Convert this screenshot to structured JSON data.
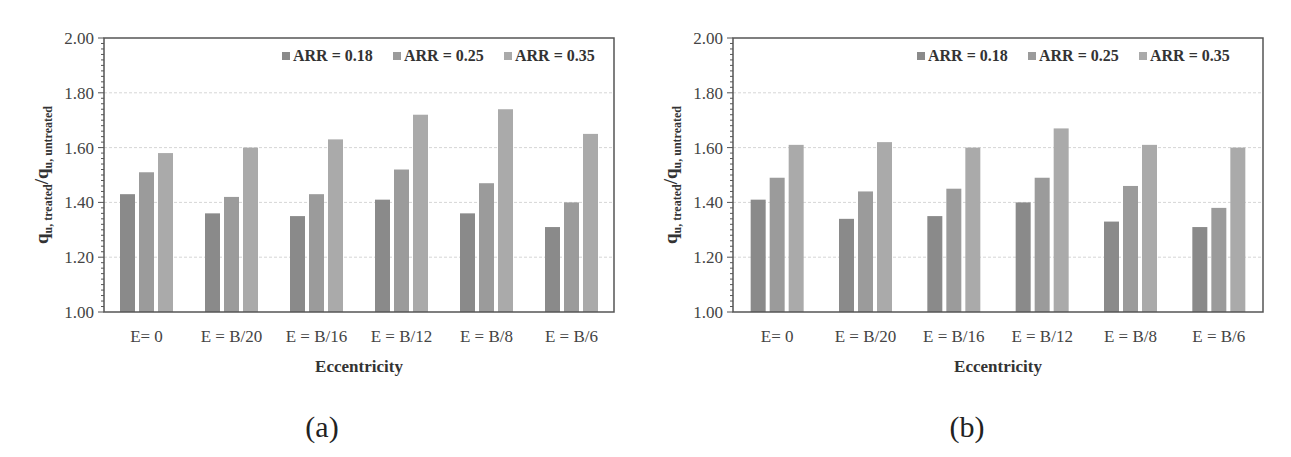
{
  "figure": {
    "captions": [
      "(a)",
      "(b)"
    ]
  },
  "colors": {
    "series": [
      "#8a8a8a",
      "#9b9b9b",
      "#aaaaaa"
    ],
    "grid": "#d6d6d6",
    "frame": "#555555"
  },
  "chart_data": [
    {
      "type": "bar",
      "panel": "(a)",
      "title": "",
      "xlabel": "Eccentricity",
      "ylabel": "q_u, treated / q_u, untreated",
      "ylabel_parts": {
        "main1": "q",
        "sub1": "u, treated",
        "slash": "/",
        "main2": "q",
        "sub2": "u, untreated"
      },
      "ylim": [
        1.0,
        2.0
      ],
      "yticks": [
        "1.00",
        "1.20",
        "1.40",
        "1.60",
        "1.80",
        "2.00"
      ],
      "grid": true,
      "legend_position": "top-right",
      "categories": [
        "E= 0",
        "E = B/20",
        "E = B/16",
        "E = B/12",
        "E = B/8",
        "E = B/6"
      ],
      "series": [
        {
          "name": "ARR = 0.18",
          "values": [
            1.43,
            1.36,
            1.35,
            1.41,
            1.36,
            1.31
          ]
        },
        {
          "name": "ARR = 0.25",
          "values": [
            1.51,
            1.42,
            1.43,
            1.52,
            1.47,
            1.4
          ]
        },
        {
          "name": "ARR = 0.35",
          "values": [
            1.58,
            1.6,
            1.63,
            1.72,
            1.74,
            1.65
          ]
        }
      ]
    },
    {
      "type": "bar",
      "panel": "(b)",
      "title": "",
      "xlabel": "Eccentricity",
      "ylabel": "q_u, treated / q_u, untreated",
      "ylabel_parts": {
        "main1": "q",
        "sub1": "u, treated",
        "slash": "/",
        "main2": "q",
        "sub2": "u, untreated"
      },
      "ylim": [
        1.0,
        2.0
      ],
      "yticks": [
        "1.00",
        "1.20",
        "1.40",
        "1.60",
        "1.80",
        "2.00"
      ],
      "grid": true,
      "legend_position": "top-right",
      "categories": [
        "E= 0",
        "E = B/20",
        "E = B/16",
        "E = B/12",
        "E = B/8",
        "E = B/6"
      ],
      "series": [
        {
          "name": "ARR = 0.18",
          "values": [
            1.41,
            1.34,
            1.35,
            1.4,
            1.33,
            1.31
          ]
        },
        {
          "name": "ARR = 0.25",
          "values": [
            1.49,
            1.44,
            1.45,
            1.49,
            1.46,
            1.38
          ]
        },
        {
          "name": "ARR = 0.35",
          "values": [
            1.61,
            1.62,
            1.6,
            1.67,
            1.61,
            1.6
          ]
        }
      ]
    }
  ]
}
